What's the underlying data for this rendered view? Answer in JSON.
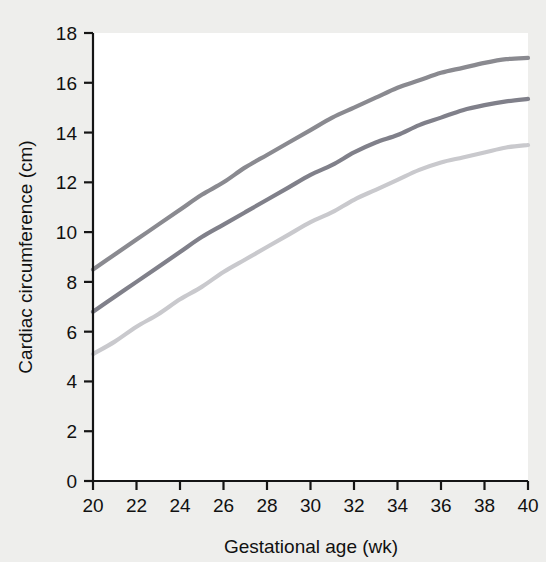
{
  "chart_data": {
    "type": "line",
    "title": "",
    "subtitle": "",
    "xlabel": "Gestational age (wk)",
    "ylabel": "Cardiac circumference (cm)",
    "xlim": [
      20,
      40
    ],
    "ylim": [
      0,
      18
    ],
    "xticks": [
      20,
      22,
      24,
      26,
      28,
      30,
      32,
      34,
      36,
      38,
      40
    ],
    "yticks": [
      0,
      2,
      4,
      6,
      8,
      10,
      12,
      14,
      16,
      18
    ],
    "xtick_labels": [
      "20",
      "22",
      "24",
      "26",
      "28",
      "30",
      "32",
      "34",
      "36",
      "38",
      "40"
    ],
    "ytick_labels": [
      "0",
      "2",
      "4",
      "6",
      "8",
      "10",
      "12",
      "14",
      "16",
      "18"
    ],
    "grid": false,
    "legend": "none",
    "x": [
      20,
      21,
      22,
      23,
      24,
      25,
      26,
      27,
      28,
      29,
      30,
      31,
      32,
      33,
      34,
      35,
      36,
      37,
      38,
      39,
      40
    ],
    "series": [
      {
        "name": "Upper percentile",
        "color": "#8a8a90",
        "values": [
          8.5,
          9.1,
          9.7,
          10.3,
          10.9,
          11.5,
          12.0,
          12.6,
          13.1,
          13.6,
          14.1,
          14.6,
          15.0,
          15.4,
          15.8,
          16.1,
          16.4,
          16.6,
          16.8,
          16.95,
          17.0
        ]
      },
      {
        "name": "Mean",
        "color": "#80808a",
        "values": [
          6.8,
          7.4,
          8.0,
          8.6,
          9.2,
          9.8,
          10.3,
          10.8,
          11.3,
          11.8,
          12.3,
          12.7,
          13.2,
          13.6,
          13.9,
          14.3,
          14.6,
          14.9,
          15.1,
          15.25,
          15.35
        ]
      },
      {
        "name": "Lower percentile",
        "color": "#c9c9cd",
        "values": [
          5.1,
          5.6,
          6.2,
          6.7,
          7.3,
          7.8,
          8.4,
          8.9,
          9.4,
          9.9,
          10.4,
          10.8,
          11.3,
          11.7,
          12.1,
          12.5,
          12.8,
          13.0,
          13.2,
          13.4,
          13.5
        ]
      }
    ]
  },
  "axes": {
    "x_title": "Gestational age (wk)",
    "y_title": "Cardiac circumference (cm)"
  }
}
